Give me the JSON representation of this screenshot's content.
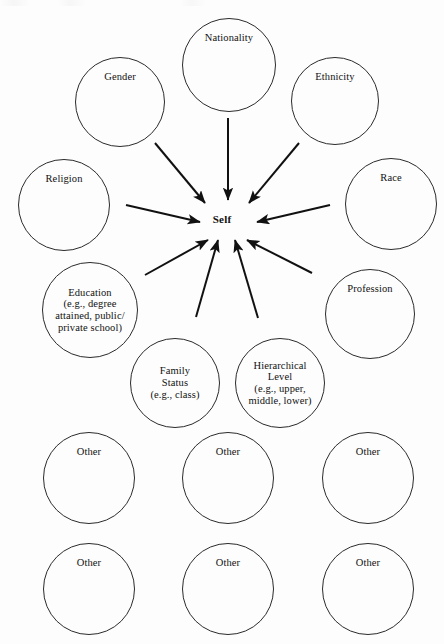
{
  "figure": {
    "center_label": "Self",
    "stroke_color": "#2b2b2b",
    "arrow_color": "#111111",
    "background_color": "#fdfdfd"
  },
  "nodes": [
    {
      "id": "nationality",
      "label": "Nationality",
      "cx": 229,
      "cy": 65,
      "r": 47,
      "label_pos": "top"
    },
    {
      "id": "gender",
      "label": "Gender",
      "cx": 120,
      "cy": 102,
      "r": 45,
      "label_pos": "top"
    },
    {
      "id": "ethnicity",
      "label": "Ethnicity",
      "cx": 335,
      "cy": 101,
      "r": 44,
      "label_pos": "top"
    },
    {
      "id": "religion",
      "label": "Religion",
      "cx": 64,
      "cy": 205,
      "r": 46,
      "label_pos": "top"
    },
    {
      "id": "race",
      "label": "Race",
      "cx": 391,
      "cy": 204,
      "r": 46,
      "label_pos": "top"
    },
    {
      "id": "education",
      "label": "Education\n(e.g., degree\nattained, public/\nprivate school)",
      "cx": 90,
      "cy": 310,
      "r": 48,
      "label_pos": "mid"
    },
    {
      "id": "profession",
      "label": "Profession",
      "cx": 370,
      "cy": 314,
      "r": 45,
      "label_pos": "top"
    },
    {
      "id": "family-status",
      "label": "Family\nStatus\n(e.g., class)",
      "cx": 175,
      "cy": 383,
      "r": 45,
      "label_pos": "mid"
    },
    {
      "id": "hierarchical-level",
      "label": "Hierarchical\nLevel\n(e.g., upper,\nmiddle, lower)",
      "cx": 280,
      "cy": 383,
      "r": 45,
      "label_pos": "mid"
    },
    {
      "id": "other-1",
      "label": "Other",
      "cx": 89,
      "cy": 478,
      "r": 46,
      "label_pos": "top"
    },
    {
      "id": "other-2",
      "label": "Other",
      "cx": 228,
      "cy": 478,
      "r": 46,
      "label_pos": "top"
    },
    {
      "id": "other-3",
      "label": "Other",
      "cx": 368,
      "cy": 478,
      "r": 46,
      "label_pos": "top"
    },
    {
      "id": "other-4",
      "label": "Other",
      "cx": 89,
      "cy": 589,
      "r": 46,
      "label_pos": "top"
    },
    {
      "id": "other-5",
      "label": "Other",
      "cx": 228,
      "cy": 589,
      "r": 46,
      "label_pos": "top"
    },
    {
      "id": "other-6",
      "label": "Other",
      "cx": 368,
      "cy": 589,
      "r": 46,
      "label_pos": "top"
    }
  ],
  "center": {
    "x": 222,
    "y": 219
  },
  "arrows": [
    {
      "id": "arrow-nationality-to-self",
      "from": "nationality",
      "to": "self",
      "x1": 228,
      "y1": 118,
      "x2": 228,
      "y2": 200,
      "width": 2.0
    },
    {
      "id": "arrow-gender-to-self",
      "from": "gender",
      "to": "self",
      "x1": 155,
      "y1": 143,
      "x2": 205,
      "y2": 203,
      "width": 2.0
    },
    {
      "id": "arrow-ethnicity-to-self",
      "from": "ethnicity",
      "to": "self",
      "x1": 299,
      "y1": 143,
      "x2": 249,
      "y2": 203,
      "width": 2.0
    },
    {
      "id": "arrow-religion-to-self",
      "from": "religion",
      "to": "self",
      "x1": 126,
      "y1": 205,
      "x2": 200,
      "y2": 222,
      "width": 2.0
    },
    {
      "id": "arrow-race-to-self",
      "from": "race",
      "to": "self",
      "x1": 330,
      "y1": 205,
      "x2": 257,
      "y2": 222,
      "width": 2.0
    },
    {
      "id": "arrow-education-to-self",
      "from": "education",
      "to": "self",
      "x1": 145,
      "y1": 275,
      "x2": 208,
      "y2": 240,
      "width": 2.0
    },
    {
      "id": "arrow-family-status-to-self",
      "from": "family-status",
      "to": "self",
      "x1": 196,
      "y1": 317,
      "x2": 218,
      "y2": 240,
      "width": 2.0
    },
    {
      "id": "arrow-hierarchical-to-self",
      "from": "hierarchical-level",
      "to": "self",
      "x1": 258,
      "y1": 318,
      "x2": 235,
      "y2": 240,
      "width": 2.0
    },
    {
      "id": "arrow-profession-to-self",
      "from": "profession",
      "to": "self",
      "x1": 312,
      "y1": 273,
      "x2": 247,
      "y2": 240,
      "width": 2.0
    }
  ]
}
